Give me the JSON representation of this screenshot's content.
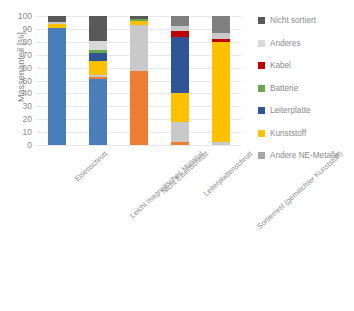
{
  "chart_data": {
    "type": "bar",
    "stacked": true,
    "title": "",
    "xlabel": "",
    "ylabel": "Massenanteil [%]",
    "ylim": [
      0,
      100
    ],
    "ytick_step": 10,
    "yticks": [
      "0",
      "10",
      "20",
      "30",
      "40",
      "50",
      "60",
      "70",
      "80",
      "90",
      "100"
    ],
    "grid": true,
    "legend_position": "right",
    "categories": [
      "Eisenschrott",
      "Leicht magnetisches Material",
      "Nicht Eisenschrott",
      "Leiterplattenschrott",
      "Sortierrest (gemischter Kunststoff)"
    ],
    "series": [
      {
        "name": "Eisenschrott",
        "color": "#4a7ebb",
        "values": [
          91.0,
          51.0,
          0.0,
          0.0,
          0.0
        ]
      },
      {
        "name": "Andere NE-Metalle",
        "color": "#ed7d31",
        "values": [
          0.0,
          2.0,
          57.0,
          2.5,
          0.0
        ]
      },
      {
        "name": "Kunststoff",
        "color": "#ffc000",
        "values": [
          2.5,
          11.0,
          3.0,
          22.0,
          80.0
        ]
      },
      {
        "name": "Leiterplatte",
        "color": "#2f5597",
        "values": [
          0.0,
          6.0,
          0.0,
          44.0,
          0.0
        ]
      },
      {
        "name": "Batterie",
        "color": "#6aa84f",
        "values": [
          0.0,
          3.0,
          2.0,
          0.0,
          0.0
        ]
      },
      {
        "name": "Kabel",
        "color": "#c00000",
        "values": [
          0.0,
          0.0,
          0.0,
          4.0,
          2.0
        ]
      },
      {
        "name": "Anderes",
        "color": "#c9c9c9",
        "values": [
          1.5,
          7.0,
          33.0,
          19.0,
          5.0
        ]
      },
      {
        "name": "Nicht sortiert",
        "color": "#595959",
        "values": [
          5.0,
          19.0,
          2.0,
          8.0,
          13.0
        ]
      }
    ],
    "bar_stacks": [
      {
        "category": "Eisenschrott",
        "segments": [
          {
            "label": "Eisenschrott",
            "color": "#4a7ebb",
            "start": 0.0,
            "end": 91.0
          },
          {
            "label": "Kunststoff",
            "color": "#ffc000",
            "start": 91.0,
            "end": 93.5
          },
          {
            "label": "Anderes",
            "color": "#c9c9c9",
            "start": 93.5,
            "end": 95.0
          },
          {
            "label": "Nicht sortiert",
            "color": "#595959",
            "start": 95.0,
            "end": 100.0
          }
        ]
      },
      {
        "category": "Leicht magnetisches Material",
        "segments": [
          {
            "label": "Eisenschrott",
            "color": "#4a7ebb",
            "start": 0.0,
            "end": 51.0
          },
          {
            "label": "Andere NE-Metalle",
            "color": "#ed7d31",
            "start": 51.0,
            "end": 53.0
          },
          {
            "label": "Anderes",
            "color": "#c9c9c9",
            "start": 53.0,
            "end": 54.0
          },
          {
            "label": "Kunststoff",
            "color": "#ffc000",
            "start": 54.0,
            "end": 65.0
          },
          {
            "label": "Leiterplatte",
            "color": "#2f5597",
            "start": 65.0,
            "end": 71.0
          },
          {
            "label": "Batterie",
            "color": "#6aa84f",
            "start": 71.0,
            "end": 74.0
          },
          {
            "label": "Anderes",
            "color": "#d9d9d9",
            "start": 74.0,
            "end": 81.0
          },
          {
            "label": "Nicht sortiert",
            "color": "#595959",
            "start": 81.0,
            "end": 100.0
          }
        ]
      },
      {
        "category": "Nicht Eisenschrott",
        "segments": [
          {
            "label": "Andere NE-Metalle",
            "color": "#ed7d31",
            "start": 0.0,
            "end": 57.0
          },
          {
            "label": "Anderes",
            "color": "#c9c9c9",
            "start": 57.0,
            "end": 93.0
          },
          {
            "label": "Kunststoff",
            "color": "#ffc000",
            "start": 93.0,
            "end": 96.0
          },
          {
            "label": "Batterie",
            "color": "#6aa84f",
            "start": 96.0,
            "end": 98.0
          },
          {
            "label": "Nicht sortiert",
            "color": "#595959",
            "start": 98.0,
            "end": 100.0
          }
        ]
      },
      {
        "category": "Leiterplattenschrott",
        "segments": [
          {
            "label": "Andere NE-Metalle",
            "color": "#ed7d31",
            "start": 0.0,
            "end": 2.5
          },
          {
            "label": "Anderes",
            "color": "#c9c9c9",
            "start": 2.5,
            "end": 18.0
          },
          {
            "label": "Kunststoff",
            "color": "#ffc000",
            "start": 18.0,
            "end": 40.0
          },
          {
            "label": "Leiterplatte",
            "color": "#2f5597",
            "start": 40.0,
            "end": 84.0
          },
          {
            "label": "Kabel",
            "color": "#c00000",
            "start": 84.0,
            "end": 88.0
          },
          {
            "label": "Anderes",
            "color": "#c9c9c9",
            "start": 88.0,
            "end": 92.0
          },
          {
            "label": "Nicht sortiert",
            "color": "#808080",
            "start": 92.0,
            "end": 100.0
          }
        ]
      },
      {
        "category": "Sortierrest (gemischter Kunststoff)",
        "segments": [
          {
            "label": "Anderes",
            "color": "#c9c9c9",
            "start": 0.0,
            "end": 2.0
          },
          {
            "label": "Kunststoff",
            "color": "#ffc000",
            "start": 2.0,
            "end": 80.0
          },
          {
            "label": "Kabel",
            "color": "#c00000",
            "start": 80.0,
            "end": 82.5
          },
          {
            "label": "Anderes",
            "color": "#c9c9c9",
            "start": 82.5,
            "end": 87.0
          },
          {
            "label": "Nicht sortiert",
            "color": "#808080",
            "start": 87.0,
            "end": 100.0
          }
        ]
      }
    ],
    "legend": [
      {
        "label": "Nicht sortiert",
        "color": "#595959"
      },
      {
        "label": "Anderes",
        "color": "#d9d9d9"
      },
      {
        "label": "Kabel",
        "color": "#c00000"
      },
      {
        "label": "Batterie",
        "color": "#6aa84f"
      },
      {
        "label": "Leiterplatte",
        "color": "#2f5597"
      },
      {
        "label": "Kunststoff",
        "color": "#ffc000"
      },
      {
        "label": "Andere NE-Metalle",
        "color": "#a6a6a6"
      }
    ]
  }
}
